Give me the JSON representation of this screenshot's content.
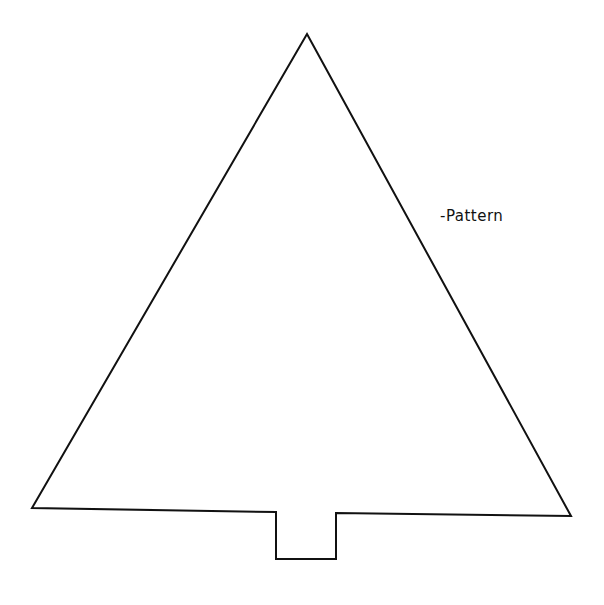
{
  "diagram": {
    "label": {
      "text": "-Pattern",
      "x": 440,
      "y": 207
    },
    "stroke_color": "#111111",
    "background": "#ffffff",
    "shape": {
      "apex": [
        307,
        34
      ],
      "bottom_left": [
        32,
        508
      ],
      "bottom_right": [
        571,
        516
      ],
      "trunk": {
        "left_x": 276,
        "right_x": 336,
        "top_left_y": 512,
        "top_right_y": 513,
        "bottom_y": 559
      }
    }
  }
}
